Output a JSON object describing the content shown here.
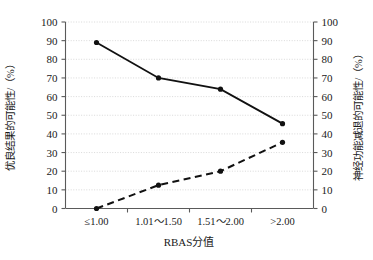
{
  "chart_data": {
    "type": "line",
    "title": "",
    "subtitle": "",
    "xlabel": "RBAS分值",
    "ylabel": "优良结果的可能性/（%）",
    "y2label": "神经功能减退的可能性/（%）",
    "categories": [
      "≤1.00",
      "1.01～1.50",
      "1.51～2.00",
      ">2.00"
    ],
    "ylim": [
      0,
      100
    ],
    "y2lim": [
      0,
      100
    ],
    "ytick_labels": [
      "0",
      "10",
      "20",
      "30",
      "40",
      "50",
      "60",
      "70",
      "80",
      "90",
      "100"
    ],
    "ytick_values": [
      0,
      10,
      20,
      30,
      40,
      50,
      60,
      70,
      80,
      90,
      100
    ],
    "y2tick_labels": [
      "0",
      "10",
      "20",
      "30",
      "40",
      "50",
      "60",
      "70",
      "80",
      "90",
      "100"
    ],
    "y2tick_values": [
      0,
      10,
      20,
      30,
      40,
      50,
      60,
      70,
      80,
      90,
      100
    ],
    "grid": true,
    "grid_axis": "y",
    "legend": "none",
    "series": [
      {
        "name": "优良结果的可能性",
        "axis": "left",
        "style": "solid",
        "marker": "filled-circle",
        "color": "#111111",
        "values": [
          89,
          70,
          64,
          45.5
        ]
      },
      {
        "name": "神经功能减退的可能性",
        "axis": "right",
        "style": "dashed",
        "marker": "filled-circle",
        "color": "#111111",
        "values": [
          0,
          12.5,
          20,
          35.5
        ]
      }
    ]
  },
  "axes": {
    "left_title": "优良结果的可能性/（%）",
    "right_title": "神经功能减退的可能性/（%）",
    "bottom_title": "RBAS分值"
  },
  "colors": {
    "series": "#111111",
    "axis": "#5a5a5a",
    "grid": "#c9c9c9",
    "background": "#ffffff"
  }
}
